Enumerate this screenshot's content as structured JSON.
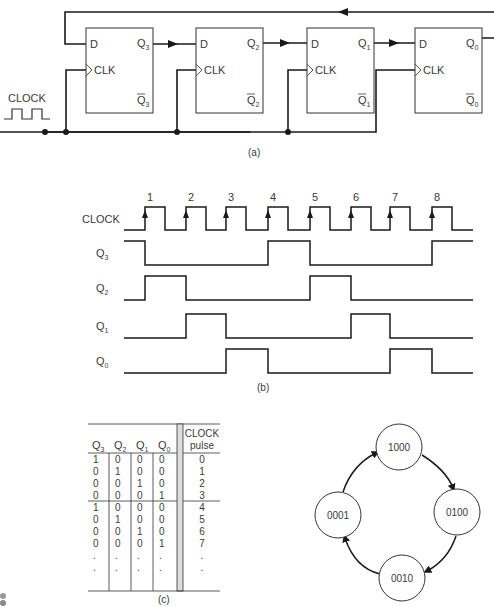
{
  "figure": {
    "panel_a": {
      "caption": "(a)",
      "clock_label": "CLOCK",
      "flip_flops": [
        {
          "name": "FF3",
          "d_label": "D",
          "clk_label": "CLK",
          "q_label": "Q",
          "q_sub": "3",
          "qbar_label": "Q",
          "qbar_sub": "3"
        },
        {
          "name": "FF2",
          "d_label": "D",
          "clk_label": "CLK",
          "q_label": "Q",
          "q_sub": "2",
          "qbar_label": "Q",
          "qbar_sub": "2"
        },
        {
          "name": "FF1",
          "d_label": "D",
          "clk_label": "CLK",
          "q_label": "Q",
          "q_sub": "1",
          "qbar_label": "Q",
          "qbar_sub": "1"
        },
        {
          "name": "FF0",
          "d_label": "D",
          "clk_label": "CLK",
          "q_label": "Q",
          "q_sub": "0",
          "qbar_label": "Q",
          "qbar_sub": "0"
        }
      ]
    },
    "panel_b": {
      "caption": "(b)",
      "signals": [
        {
          "label": "CLOCK",
          "sub": ""
        },
        {
          "label": "Q",
          "sub": "3",
          "initial": 1,
          "values_after_pulse": [
            0,
            0,
            0,
            1,
            0,
            0,
            0,
            1
          ]
        },
        {
          "label": "Q",
          "sub": "2",
          "initial": 0,
          "values_after_pulse": [
            1,
            0,
            0,
            0,
            1,
            0,
            0,
            0
          ]
        },
        {
          "label": "Q",
          "sub": "1",
          "initial": 0,
          "values_after_pulse": [
            0,
            1,
            0,
            0,
            0,
            1,
            0,
            0
          ]
        },
        {
          "label": "Q",
          "sub": "0",
          "initial": 0,
          "values_after_pulse": [
            0,
            0,
            1,
            0,
            0,
            0,
            1,
            0
          ]
        }
      ],
      "pulse_numbers": [
        "1",
        "2",
        "3",
        "4",
        "5",
        "6",
        "7",
        "8"
      ]
    },
    "panel_c": {
      "caption": "(c)",
      "headers": [
        {
          "label": "Q",
          "sub": "3"
        },
        {
          "label": "Q",
          "sub": "2"
        },
        {
          "label": "Q",
          "sub": "1"
        },
        {
          "label": "Q",
          "sub": "0"
        }
      ],
      "pulse_header_line1": "CLOCK",
      "pulse_header_line2": "pulse",
      "rows": [
        [
          "1",
          "0",
          "0",
          "0",
          "0"
        ],
        [
          "0",
          "1",
          "0",
          "0",
          "1"
        ],
        [
          "0",
          "0",
          "1",
          "0",
          "2"
        ],
        [
          "0",
          "0",
          "0",
          "1",
          "3"
        ],
        [
          "1",
          "0",
          "0",
          "0",
          "4"
        ],
        [
          "0",
          "1",
          "0",
          "0",
          "5"
        ],
        [
          "0",
          "0",
          "1",
          "0",
          "6"
        ],
        [
          "0",
          "0",
          "0",
          "1",
          "7"
        ],
        [
          ".",
          ".",
          ".",
          ".",
          "."
        ],
        [
          ".",
          ".",
          ".",
          ".",
          "."
        ]
      ]
    },
    "panel_d": {
      "states": [
        "1000",
        "0100",
        "0010",
        "0001"
      ]
    }
  }
}
